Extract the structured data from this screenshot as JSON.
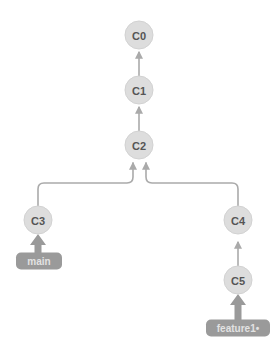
{
  "diagram": {
    "type": "git-commit-tree",
    "colors": {
      "background": "#ffffff",
      "commit_fill": "#dddddd",
      "commit_stroke": "#d2d2d2",
      "commit_text": "#555555",
      "edge": "#aaaaaa",
      "badge_fill": "#9a9a9a",
      "badge_text": "#e2e2e2",
      "head_arrow": "#9a9a9a"
    },
    "commits": [
      {
        "id": "C0",
        "label": "C0",
        "x": 139,
        "y": 35,
        "r": 14
      },
      {
        "id": "C1",
        "label": "C1",
        "x": 139,
        "y": 90,
        "r": 14
      },
      {
        "id": "C2",
        "label": "C2",
        "x": 139,
        "y": 145,
        "r": 14
      },
      {
        "id": "C3",
        "label": "C3",
        "x": 38,
        "y": 220,
        "r": 14
      },
      {
        "id": "C4",
        "label": "C4",
        "x": 238,
        "y": 220,
        "r": 14
      },
      {
        "id": "C5",
        "label": "C5",
        "x": 238,
        "y": 280,
        "r": 14
      }
    ],
    "edges": [
      {
        "from": "C1",
        "to": "C0",
        "kind": "straight"
      },
      {
        "from": "C2",
        "to": "C1",
        "kind": "straight"
      },
      {
        "from": "C3",
        "to": "C2",
        "kind": "elbow-right"
      },
      {
        "from": "C4",
        "to": "C2",
        "kind": "elbow-left"
      },
      {
        "from": "C5",
        "to": "C4",
        "kind": "straight"
      }
    ],
    "branches": [
      {
        "name": "main",
        "label": "main",
        "target": "C3",
        "checked_out": false,
        "x": 39,
        "y": 261,
        "width": 46,
        "height": 17
      },
      {
        "name": "feature1",
        "label": "feature1•",
        "target": "C5",
        "checked_out": true,
        "x": 238,
        "y": 328,
        "width": 64,
        "height": 17
      }
    ]
  }
}
